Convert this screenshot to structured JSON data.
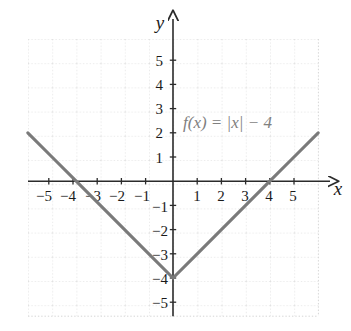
{
  "chart_data": {
    "type": "line",
    "title": "",
    "subtitle": "",
    "xlabel": "x",
    "ylabel": "y",
    "xlim": [
      -6,
      6
    ],
    "ylim": [
      -6,
      6
    ],
    "grid": true,
    "legend_position": "none",
    "annotations": [
      {
        "name": "function-equation",
        "text": "f(x) = |x| − 4",
        "x": 3.2,
        "y": 2.3
      }
    ],
    "xticks": [
      -5,
      -4,
      -3,
      -2,
      -1,
      1,
      2,
      3,
      4,
      5
    ],
    "xtick_labels": [
      "−5",
      "−4",
      "−3",
      "−2",
      "−1",
      "1",
      "2",
      "3",
      "4",
      "5"
    ],
    "yticks": [
      5,
      4,
      3,
      2,
      1,
      -1,
      -2,
      -3,
      -4,
      -5
    ],
    "ytick_labels": [
      "5",
      "4",
      "3",
      "2",
      "1",
      "−1",
      "−2",
      "−3",
      "−4",
      "−5"
    ],
    "series": [
      {
        "name": "f(x) = |x| - 4",
        "equation": "f(x) = |x| - 4",
        "color": "#7a7a7a",
        "x": [
          -6,
          -5,
          -4,
          -3,
          -2,
          -1,
          0,
          1,
          2,
          3,
          4,
          5,
          6
        ],
        "values": [
          2,
          1,
          0,
          -1,
          -2,
          -3,
          -4,
          -3,
          -2,
          -1,
          0,
          1,
          2
        ]
      }
    ],
    "key_points": {
      "vertex": [
        0,
        -4
      ],
      "x_intercepts": [
        [
          -4,
          0
        ],
        [
          4,
          0
        ]
      ],
      "y_intercept": [
        0,
        -4
      ]
    }
  },
  "colors": {
    "curve": "#7a7a7a",
    "axis": "#2b2b2b",
    "grid": "#d8d8d8",
    "tick_label": "#1a1a1a",
    "background": "#ffffff"
  },
  "axes": {
    "x_axis_name": "x",
    "y_axis_name": "y"
  }
}
